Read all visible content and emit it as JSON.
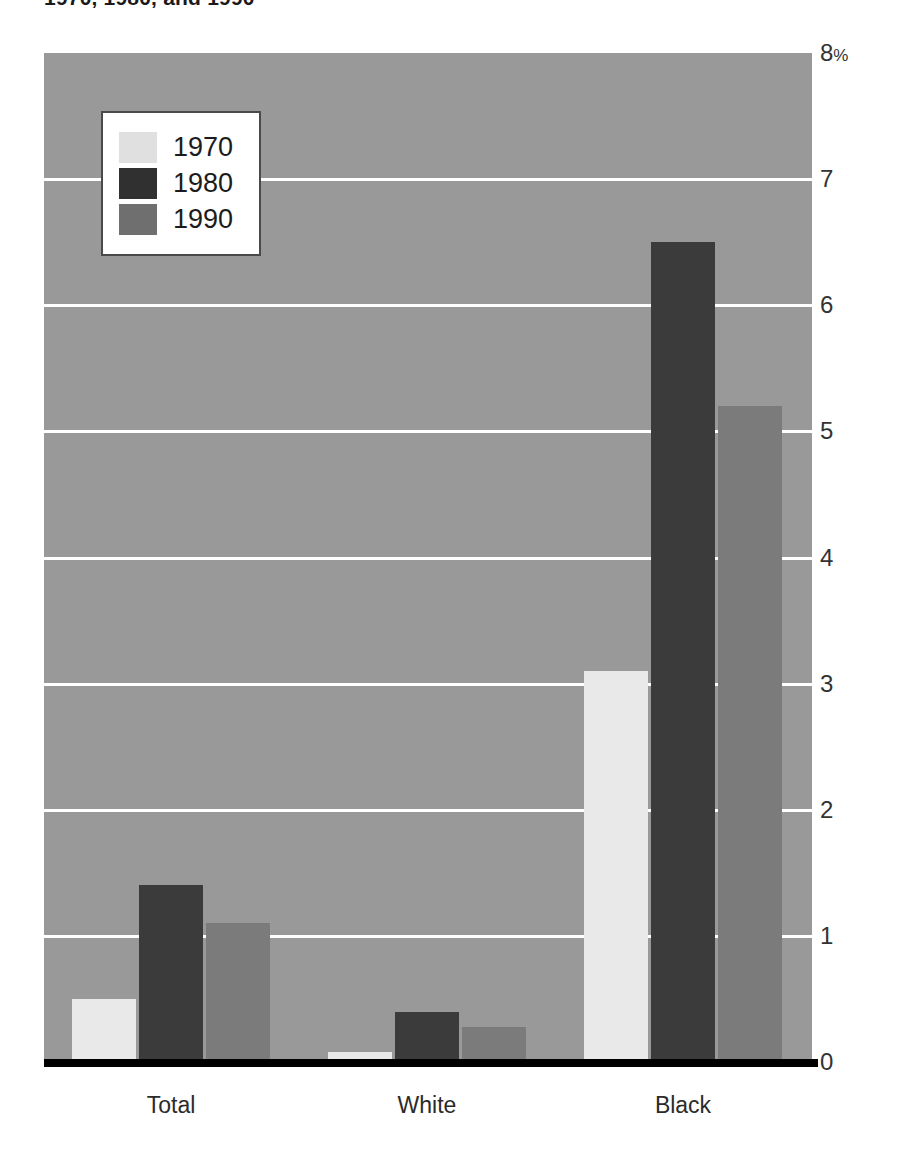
{
  "title": "1970, 1980, and 1990",
  "chart_data": {
    "type": "bar",
    "title": "1970, 1980, and 1990",
    "xlabel": "",
    "ylabel": "",
    "ylim": [
      0,
      8
    ],
    "yticks": [
      0,
      1,
      2,
      3,
      4,
      5,
      6,
      7,
      8
    ],
    "ytick_labels": [
      "0",
      "1",
      "2",
      "3",
      "4",
      "5",
      "6",
      "7",
      "8%"
    ],
    "y_unit": "%",
    "grid": true,
    "grid_color": "#ffffff",
    "legend_position": "upper-left",
    "plot_background": "#999999",
    "categories": [
      "Total",
      "White",
      "Black"
    ],
    "series": [
      {
        "name": "1970",
        "color": "#e9e9e9",
        "values": [
          0.5,
          0.08,
          3.1
        ]
      },
      {
        "name": "1980",
        "color": "#3b3b3b",
        "values": [
          1.4,
          0.4,
          6.5
        ]
      },
      {
        "name": "1990",
        "color": "#7b7b7b",
        "values": [
          1.1,
          0.28,
          5.2
        ]
      }
    ]
  },
  "legend": {
    "items": [
      {
        "label": "1970",
        "swatch": "legend-swatch-1970"
      },
      {
        "label": "1980",
        "swatch": "legend-swatch-1980"
      },
      {
        "label": "1990",
        "swatch": "legend-swatch-1990"
      }
    ]
  },
  "axis": {
    "y_labels": [
      "8",
      "7",
      "6",
      "5",
      "4",
      "3",
      "2",
      "1",
      "0"
    ],
    "y_top_suffix": "%"
  }
}
